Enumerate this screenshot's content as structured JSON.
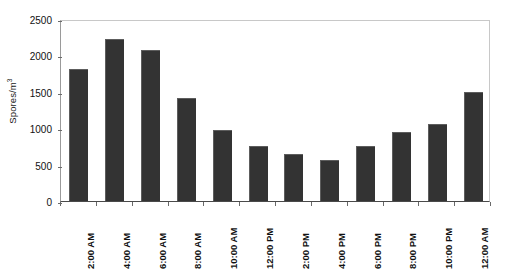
{
  "chart_data": {
    "type": "bar",
    "title": "",
    "subtitle": "",
    "xlabel": "",
    "ylabel": "Spores/m",
    "ylabel_exponent": "3",
    "ylabel_full": "Spores/m³",
    "categories": [
      "2:00 AM",
      "4:00 AM",
      "6:00 AM",
      "8:00 AM",
      "10:00 AM",
      "12:00 PM",
      "2:00 PM",
      "4:00 PM",
      "6:00 PM",
      "8:00 PM",
      "10:00 PM",
      "12:00 AM"
    ],
    "values": [
      1820,
      2230,
      2080,
      1410,
      980,
      750,
      640,
      560,
      755,
      950,
      1060,
      1500
    ],
    "ylim": [
      0,
      2500
    ],
    "ytick_values": [
      0,
      500,
      1000,
      1500,
      2000,
      2500
    ],
    "ytick_labels": [
      "0",
      "500",
      "1000",
      "1500",
      "2000",
      "2500"
    ],
    "grid": false,
    "legend": null,
    "legend_position": "none",
    "series": [
      {
        "name": "Spores/m³",
        "color": "#333333",
        "values": [
          1820,
          2230,
          2080,
          1410,
          980,
          750,
          640,
          560,
          755,
          950,
          1060,
          1500
        ]
      }
    ],
    "annotations": [],
    "bar_color": "#333333",
    "axis_color": "#4a4a4a",
    "frame_color": "#c8c8c8",
    "background": "#ffffff"
  }
}
